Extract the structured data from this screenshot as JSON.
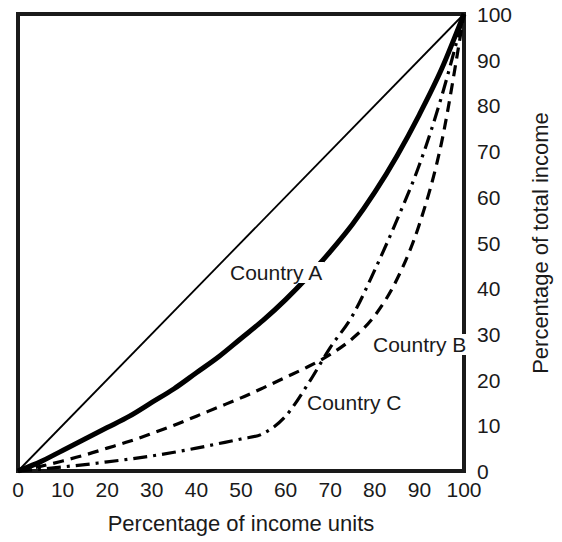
{
  "chart_data": {
    "type": "line",
    "title": "",
    "subtitle": "",
    "xlabel": "Percentage of income units",
    "ylabel": "Percentage of total income",
    "xlim": [
      0,
      100
    ],
    "ylim": [
      0,
      100
    ],
    "xticks": [
      "0",
      "10",
      "20",
      "30",
      "40",
      "50",
      "60",
      "70",
      "80",
      "90",
      "100"
    ],
    "yticks": [
      "0",
      "10",
      "20",
      "30",
      "40",
      "50",
      "60",
      "70",
      "80",
      "90",
      "100"
    ],
    "grid": false,
    "legend_position": "inline-annotations",
    "y_axis_side": "right",
    "annotations": [
      {
        "text": "Country A",
        "x": 47,
        "y": 46
      },
      {
        "text": "Country B",
        "x": 79,
        "y": 30
      },
      {
        "text": "Country C",
        "x": 64,
        "y": 17
      }
    ],
    "x": [
      0,
      5,
      10,
      15,
      20,
      25,
      30,
      35,
      40,
      45,
      50,
      55,
      60,
      65,
      70,
      75,
      80,
      85,
      90,
      95,
      100
    ],
    "series": [
      {
        "name": "Line of equality",
        "style": "solid-thin",
        "color": "#000000",
        "values": [
          0,
          5,
          10,
          15,
          20,
          25,
          30,
          35,
          40,
          45,
          50,
          55,
          60,
          65,
          70,
          75,
          80,
          85,
          90,
          95,
          100
        ]
      },
      {
        "name": "Country A",
        "style": "solid-thick",
        "color": "#000000",
        "values": [
          0,
          2,
          4.5,
          7,
          9.5,
          12,
          15,
          18,
          21.5,
          25,
          29,
          33,
          37.5,
          42.5,
          48,
          54,
          61,
          69,
          78,
          88,
          100
        ]
      },
      {
        "name": "Country B",
        "style": "dashed",
        "color": "#000000",
        "values": [
          0,
          1,
          2.2,
          3.5,
          5,
          6.5,
          8.2,
          10,
          12,
          14,
          16,
          18.2,
          20.5,
          22.8,
          25.5,
          29,
          34,
          42,
          54,
          72,
          100
        ]
      },
      {
        "name": "Country C",
        "style": "dash-dot",
        "color": "#000000",
        "values": [
          0,
          0.4,
          0.9,
          1.4,
          2,
          2.6,
          3.3,
          4.1,
          5,
          6,
          7,
          8.2,
          12,
          19,
          27,
          34,
          44,
          55,
          67,
          82,
          100
        ]
      }
    ]
  },
  "axes": {
    "x_title": "Percentage of income units",
    "y_title": "Percentage of total income",
    "x_tick_labels": [
      "0",
      "10",
      "20",
      "30",
      "40",
      "50",
      "60",
      "70",
      "80",
      "90",
      "100"
    ],
    "y_tick_labels": [
      "0",
      "10",
      "20",
      "30",
      "40",
      "50",
      "60",
      "70",
      "80",
      "90",
      "100"
    ]
  },
  "labels": {
    "country_a": "Country A",
    "country_b": "Country B",
    "country_c": "Country C"
  },
  "colors": {
    "line": "#000000",
    "frame": "#1a1a1a",
    "background": "#ffffff",
    "text": "#1a1a1a"
  }
}
